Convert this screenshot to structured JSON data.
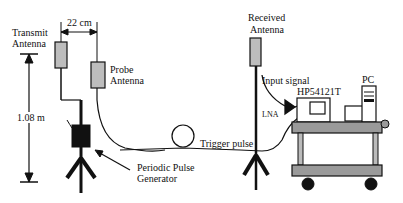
{
  "diagram": {
    "labels": {
      "transmit_antenna_line1": "Transmit",
      "transmit_antenna_line2": "Antenna",
      "spacing": "22 cm",
      "probe_antenna_line1": "Probe",
      "probe_antenna_line2": "Antenna",
      "height": "1.08 m",
      "pulse_generator_line1": "Periodic Pulse",
      "pulse_generator_line2": "Generator",
      "trigger_pulse": "Trigger pulse",
      "received_antenna_line1": "Received",
      "received_antenna_line2": "Antenna",
      "input_signal": "Input signal",
      "oscilloscope": "HP54121T",
      "pc": "PC",
      "lna": "LNA"
    },
    "colors": {
      "ink": "#111111",
      "antenna_fill": "#bdbdbd",
      "cart_fill": "#9a9a9a",
      "background": "#ffffff"
    }
  }
}
